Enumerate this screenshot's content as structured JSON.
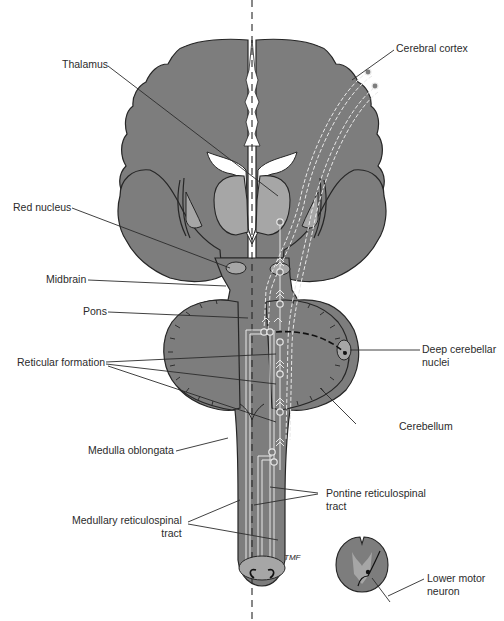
{
  "diagram": {
    "colors": {
      "tissue": "#7d7d7d",
      "tissue_light": "#a6a6a6",
      "outline": "#262626",
      "ventricle": "#ffffff",
      "tract": "#e8e8e8",
      "leader": "#2b2b2b",
      "background": "#ffffff"
    },
    "labels": {
      "thalamus": "Thalamus",
      "cerebral_cortex": "Cerebral cortex",
      "red_nucleus": "Red nucleus",
      "midbrain": "Midbrain",
      "pons": "Pons",
      "reticular_formation": "Reticular formation",
      "deep_cerebellar_nuclei": "Deep cerebellar\nnuclei",
      "cerebellum": "Cerebellum",
      "medulla_oblongata": "Medulla oblongata",
      "pontine_reticulospinal_tract": "Pontine reticulospinal\ntract",
      "medullary_reticulospinal_tract": "Medullary reticulospinal\ntract",
      "lower_motor_neuron": "Lower motor\nneuron"
    },
    "annotations": {
      "artist_initials": "TMF"
    }
  }
}
